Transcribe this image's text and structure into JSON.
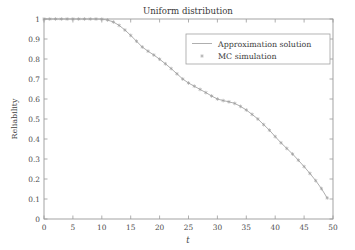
{
  "figure": {
    "background_color": "#ffffff",
    "axis_color": "#9a9a9a",
    "text_color": "#3d3d3d"
  },
  "chart_data": {
    "type": "line",
    "title": "Uniform distribution",
    "xlabel": "t",
    "ylabel": "Reliability",
    "xlim": [
      0,
      50
    ],
    "ylim": [
      0,
      1
    ],
    "grid": false,
    "legend_position": "upper right",
    "xticks": [
      "0",
      "5",
      "10",
      "15",
      "20",
      "25",
      "30",
      "35",
      "40",
      "45",
      "50"
    ],
    "xtick_values": [
      0,
      5,
      10,
      15,
      20,
      25,
      30,
      35,
      40,
      45,
      50
    ],
    "yticks": [
      "0",
      "0.1",
      "0.2",
      "0.3",
      "0.4",
      "0.5",
      "0.6",
      "0.7",
      "0.8",
      "0.9",
      "1"
    ],
    "ytick_values": [
      0,
      0.1,
      0.2,
      0.3,
      0.4,
      0.5,
      0.6,
      0.7,
      0.8,
      0.9,
      1
    ],
    "series": [
      {
        "name": "Approximation solution",
        "style": "line",
        "color": "#a6a6a6",
        "x": [
          0,
          1,
          2,
          3,
          4,
          5,
          6,
          7,
          8,
          9,
          10,
          11,
          12,
          13,
          14,
          15,
          16,
          17,
          18,
          19,
          20,
          21,
          22,
          23,
          24,
          25,
          26,
          27,
          28,
          29,
          30,
          31,
          32,
          33,
          34,
          35,
          36,
          37,
          38,
          39,
          40,
          41,
          42,
          43,
          44,
          45,
          46,
          47,
          48,
          49
        ],
        "values": [
          1.0,
          1.0,
          1.0,
          1.0,
          1.0,
          1.0,
          1.0,
          1.0,
          1.0,
          1.0,
          0.999,
          0.995,
          0.985,
          0.968,
          0.945,
          0.918,
          0.889,
          0.86,
          0.839,
          0.82,
          0.799,
          0.776,
          0.752,
          0.726,
          0.7,
          0.68,
          0.664,
          0.648,
          0.632,
          0.615,
          0.6,
          0.592,
          0.586,
          0.578,
          0.563,
          0.545,
          0.523,
          0.5,
          0.472,
          0.444,
          0.412,
          0.381,
          0.353,
          0.325,
          0.294,
          0.262,
          0.228,
          0.192,
          0.152,
          0.105
        ]
      },
      {
        "name": "MC simulation",
        "style": "marker",
        "marker": "asterisk",
        "color": "#9d9d9d",
        "x": [
          0,
          1,
          2,
          3,
          4,
          5,
          6,
          7,
          8,
          9,
          10,
          11,
          12,
          13,
          14,
          15,
          16,
          17,
          18,
          19,
          20,
          21,
          22,
          23,
          24,
          25,
          26,
          27,
          28,
          29,
          30,
          31,
          32,
          33,
          34,
          35,
          36,
          37,
          38,
          39,
          40,
          41,
          42,
          43,
          44,
          45,
          46,
          47,
          48,
          49
        ],
        "values": [
          1.0,
          1.0,
          1.0,
          1.0,
          1.0,
          1.0,
          1.0,
          1.0,
          1.0,
          1.0,
          0.999,
          0.995,
          0.985,
          0.968,
          0.945,
          0.918,
          0.889,
          0.86,
          0.839,
          0.82,
          0.799,
          0.776,
          0.752,
          0.726,
          0.7,
          0.68,
          0.664,
          0.648,
          0.632,
          0.615,
          0.6,
          0.592,
          0.586,
          0.578,
          0.563,
          0.545,
          0.523,
          0.5,
          0.472,
          0.444,
          0.412,
          0.381,
          0.353,
          0.325,
          0.294,
          0.262,
          0.228,
          0.192,
          0.152,
          0.105
        ]
      }
    ],
    "legend": [
      {
        "label": "Approximation solution",
        "style": "line"
      },
      {
        "label": "MC simulation",
        "style": "marker"
      }
    ]
  }
}
